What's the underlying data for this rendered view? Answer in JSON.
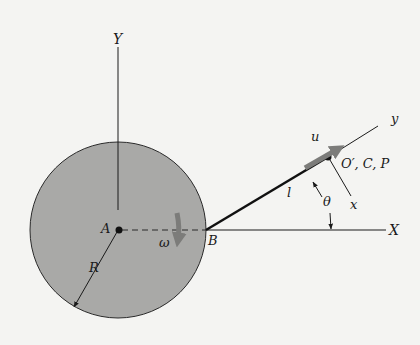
{
  "diagram": {
    "type": "kinematics-figure",
    "labels": {
      "Y_axis": "Y",
      "X_axis": "X",
      "center": "A",
      "rim_point": "B",
      "angular_velocity": "ω",
      "radius": "R",
      "link_length": "l",
      "angle": "θ",
      "velocity": "u",
      "local_x": "x",
      "local_y": "y",
      "end_point": "O′, C, P"
    },
    "colors": {
      "background": "#f4f4f2",
      "disk_fill": "#a9a9a7",
      "line": "#1a1a1a",
      "arrow_gray": "#7c7c7a"
    }
  }
}
